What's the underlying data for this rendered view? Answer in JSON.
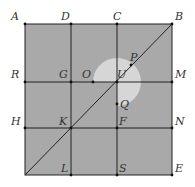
{
  "diagram": {
    "square": {
      "x1": 25,
      "y1": 24,
      "x2": 172,
      "y2": 175,
      "fill": "#a9a9a9",
      "stroke": "#222222"
    },
    "grid_x": [
      71,
      117
    ],
    "grid_y": [
      82,
      128
    ],
    "diagonal": {
      "from": [
        25,
        175
      ],
      "to": [
        172,
        24
      ]
    },
    "sector": {
      "cx": 117,
      "cy": 82,
      "r": 24,
      "fill": "#d6d6d6",
      "start_point": "O",
      "end_point": "Q",
      "sweep_degrees": 270
    },
    "points": [
      {
        "name": "A",
        "x": 25,
        "y": 24,
        "lx": 11,
        "ly": 20
      },
      {
        "name": "D",
        "x": 71,
        "y": 24,
        "lx": 61,
        "ly": 20
      },
      {
        "name": "C",
        "x": 117,
        "y": 24,
        "lx": 113,
        "ly": 20
      },
      {
        "name": "B",
        "x": 172,
        "y": 24,
        "lx": 175,
        "ly": 20
      },
      {
        "name": "R",
        "x": 25,
        "y": 82,
        "lx": 11,
        "ly": 78
      },
      {
        "name": "G",
        "x": 71,
        "y": 82,
        "lx": 59,
        "ly": 78
      },
      {
        "name": "O",
        "x": 93,
        "y": 82,
        "lx": 82,
        "ly": 78
      },
      {
        "name": "U",
        "x": 117,
        "y": 82,
        "lx": 117,
        "ly": 78
      },
      {
        "name": "P",
        "x": 131,
        "y": 65,
        "lx": 130,
        "ly": 61
      },
      {
        "name": "M",
        "x": 172,
        "y": 82,
        "lx": 175,
        "ly": 78
      },
      {
        "name": "Q",
        "x": 117,
        "y": 104,
        "lx": 120,
        "ly": 108
      },
      {
        "name": "H",
        "x": 25,
        "y": 128,
        "lx": 11,
        "ly": 125
      },
      {
        "name": "K",
        "x": 71,
        "y": 128,
        "lx": 59,
        "ly": 125
      },
      {
        "name": "F",
        "x": 117,
        "y": 128,
        "lx": 119,
        "ly": 125
      },
      {
        "name": "N",
        "x": 172,
        "y": 128,
        "lx": 175,
        "ly": 125
      },
      {
        "name": "L",
        "x": 71,
        "y": 175,
        "lx": 61,
        "ly": 172
      },
      {
        "name": "S",
        "x": 117,
        "y": 175,
        "lx": 119,
        "ly": 172
      },
      {
        "name": "E",
        "x": 172,
        "y": 175,
        "lx": 175,
        "ly": 172
      }
    ]
  }
}
